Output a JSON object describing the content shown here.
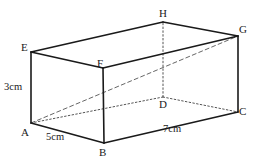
{
  "figure": {
    "type": "cuboid-net-diagram",
    "stroke_color": "#1a1a1a",
    "hidden_edge_color": "#555555",
    "diagonal_color": "#666666",
    "background_color": "#ffffff"
  },
  "vertices": [
    {
      "id": "E",
      "label": "E",
      "x": 31,
      "y": 52,
      "label_x": 21,
      "label_y": 42,
      "hidden": false
    },
    {
      "id": "F",
      "label": "F",
      "x": 103,
      "y": 68,
      "label_x": 97,
      "label_y": 58,
      "hidden": false
    },
    {
      "id": "H",
      "label": "H",
      "x": 163,
      "y": 22,
      "label_x": 159,
      "label_y": 8,
      "hidden": false
    },
    {
      "id": "G",
      "label": "G",
      "x": 238,
      "y": 36,
      "label_x": 239,
      "label_y": 24,
      "hidden": false
    },
    {
      "id": "A",
      "label": "A",
      "x": 31,
      "y": 123,
      "label_x": 21,
      "label_y": 127,
      "hidden": false
    },
    {
      "id": "B",
      "label": "B",
      "x": 104,
      "y": 143,
      "label_x": 99,
      "label_y": 147,
      "hidden": false
    },
    {
      "id": "D",
      "label": "D",
      "x": 163,
      "y": 97,
      "label_x": 159,
      "label_y": 99,
      "hidden": true
    },
    {
      "id": "C",
      "label": "C",
      "x": 238,
      "y": 112,
      "label_x": 239,
      "label_y": 106,
      "hidden": false
    }
  ],
  "edges": {
    "solid": [
      {
        "from": "E",
        "to": "H",
        "name": "edge-E-H"
      },
      {
        "from": "H",
        "to": "G",
        "name": "edge-H-G"
      },
      {
        "from": "E",
        "to": "F",
        "name": "edge-E-F"
      },
      {
        "from": "F",
        "to": "G",
        "name": "edge-F-G"
      },
      {
        "from": "E",
        "to": "A",
        "name": "edge-E-A"
      },
      {
        "from": "F",
        "to": "B",
        "name": "edge-F-B"
      },
      {
        "from": "G",
        "to": "C",
        "name": "edge-G-C"
      },
      {
        "from": "A",
        "to": "B",
        "name": "edge-A-B"
      },
      {
        "from": "B",
        "to": "C",
        "name": "edge-B-C"
      }
    ],
    "hidden": [
      {
        "from": "A",
        "to": "D",
        "name": "edge-A-D"
      },
      {
        "from": "D",
        "to": "C",
        "name": "edge-D-C"
      },
      {
        "from": "D",
        "to": "H",
        "name": "edge-D-H"
      }
    ],
    "diagonals": [
      {
        "from": "A",
        "to": "G",
        "name": "diagonal-A-G"
      }
    ]
  },
  "measurements": [
    {
      "id": "height",
      "value": "3cm",
      "edge": "E-A",
      "x": 4,
      "y": 82,
      "name": "measure-label-3cm"
    },
    {
      "id": "width",
      "value": "5cm",
      "edge": "A-B",
      "x": 46,
      "y": 132,
      "name": "measure-label-5cm"
    },
    {
      "id": "length",
      "value": "7cm",
      "edge": "B-C",
      "x": 163,
      "y": 124,
      "name": "measure-label-7cm"
    }
  ]
}
